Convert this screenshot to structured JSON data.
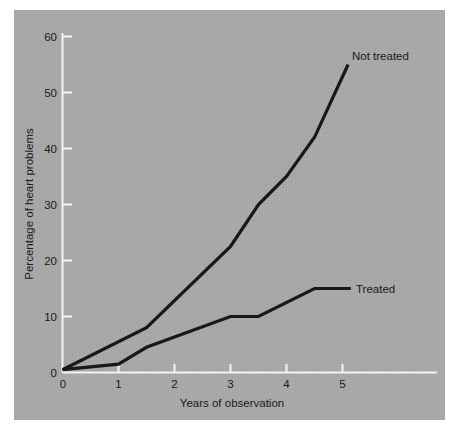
{
  "chart_data": {
    "type": "line",
    "title": "",
    "xlabel": "Years of observation",
    "ylabel": "Percentage of heart problems",
    "xlim": [
      0,
      5.6
    ],
    "ylim": [
      0,
      63
    ],
    "xticks": [
      "0",
      "1",
      "2",
      "3",
      "4",
      "5"
    ],
    "xtick_values": [
      0,
      1,
      2,
      3,
      4,
      5
    ],
    "yticks": [
      "0",
      "10",
      "20",
      "30",
      "40",
      "50",
      "60"
    ],
    "ytick_values": [
      0,
      10,
      20,
      30,
      40,
      50,
      60
    ],
    "grid": false,
    "legend_position": "inline-end-of-line",
    "background_color": "#a9a9a9",
    "line_color": "#181818",
    "axis_color": "#f2f2f2",
    "series": [
      {
        "name": "Not treated",
        "label": "Not treated",
        "x": [
          0,
          1.5,
          3,
          3.5,
          4,
          4.5,
          5.1
        ],
        "values": [
          0.5,
          8,
          22.5,
          30,
          35,
          42,
          55
        ],
        "label_x": 5.2,
        "label_y": 55.5
      },
      {
        "name": "Treated",
        "label": "Treated",
        "x": [
          0,
          1,
          1.5,
          3,
          3.5,
          4.5,
          5.15
        ],
        "values": [
          0.5,
          1.5,
          4.5,
          10,
          10,
          15,
          15
        ],
        "label_x": 5.25,
        "label_y": 15
      }
    ]
  }
}
